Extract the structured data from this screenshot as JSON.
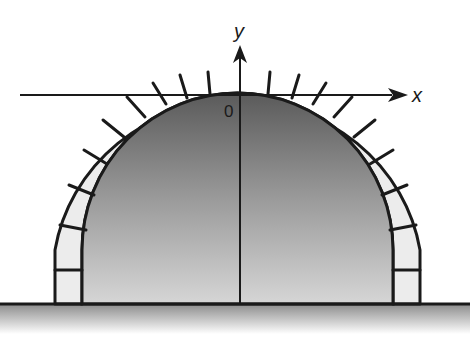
{
  "diagram": {
    "title": "",
    "axes": {
      "x_label": "x",
      "y_label": "y",
      "origin_label": "0"
    },
    "colors": {
      "stroke": "#1a1a1a",
      "stone_fill": "#ececec",
      "interior_top": "#555555",
      "interior_bottom": "#d8d8d8",
      "ground_top": "#8a8a8a",
      "ground_bottom": "#ffffff"
    }
  }
}
